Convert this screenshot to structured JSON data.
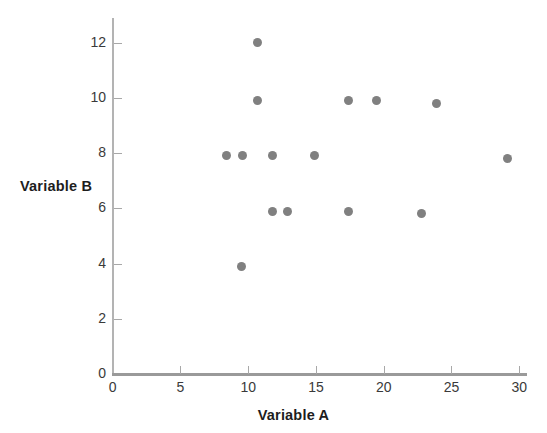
{
  "chart_data": {
    "type": "scatter",
    "title": "",
    "xlabel": "Variable A",
    "ylabel": "Variable B",
    "xlim": [
      0,
      30.6
    ],
    "ylim": [
      0,
      12.9
    ],
    "xticks": [
      0,
      5,
      10,
      15,
      20,
      25,
      30
    ],
    "yticks": [
      0,
      2,
      4,
      6,
      8,
      10,
      12
    ],
    "xticklabels": [
      "0",
      "5",
      "10",
      "15",
      "20",
      "25",
      "30"
    ],
    "yticklabels": [
      "0",
      "2",
      "4",
      "6",
      "8",
      "10",
      "12"
    ],
    "grid": false,
    "legend": false,
    "marker_color": "#808080",
    "axis_color": "#9a9a9a",
    "points": [
      {
        "x": 10.7,
        "y": 12.0
      },
      {
        "x": 10.7,
        "y": 9.9
      },
      {
        "x": 17.4,
        "y": 9.9
      },
      {
        "x": 19.5,
        "y": 9.9
      },
      {
        "x": 23.9,
        "y": 9.8
      },
      {
        "x": 8.4,
        "y": 7.9
      },
      {
        "x": 9.6,
        "y": 7.9
      },
      {
        "x": 11.8,
        "y": 7.9
      },
      {
        "x": 14.9,
        "y": 7.9
      },
      {
        "x": 29.1,
        "y": 7.8
      },
      {
        "x": 11.8,
        "y": 5.9
      },
      {
        "x": 12.9,
        "y": 5.9
      },
      {
        "x": 17.4,
        "y": 5.9
      },
      {
        "x": 22.8,
        "y": 5.8
      },
      {
        "x": 9.5,
        "y": 3.9
      }
    ]
  }
}
